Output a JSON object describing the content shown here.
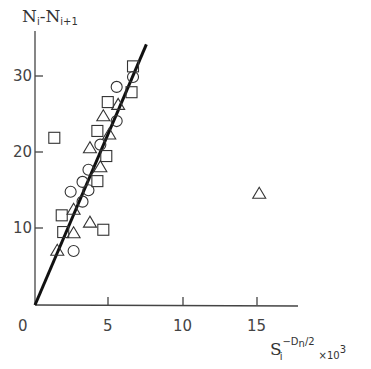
{
  "chart_data": {
    "type": "scatter",
    "title": "",
    "xlabel": "S_i^(-D_n/2) ×10^3",
    "ylabel": "N_i - N_i+1",
    "xlim": [
      0,
      18
    ],
    "ylim": [
      0,
      36
    ],
    "x_ticks": [
      "0",
      "5",
      "10",
      "15"
    ],
    "y_ticks": [
      "10",
      "20",
      "30"
    ],
    "grid": false,
    "legend": null,
    "series": [
      {
        "name": "squares",
        "marker": "square",
        "points": [
          [
            6.6,
            31.4
          ],
          [
            6.5,
            28.0
          ],
          [
            4.9,
            26.7
          ],
          [
            4.2,
            22.9
          ],
          [
            1.3,
            22.0
          ],
          [
            4.8,
            19.6
          ],
          [
            4.2,
            16.3
          ],
          [
            1.8,
            11.8
          ],
          [
            1.9,
            9.6
          ],
          [
            4.6,
            9.9
          ]
        ]
      },
      {
        "name": "circles",
        "marker": "circle",
        "points": [
          [
            6.6,
            30.0
          ],
          [
            5.5,
            28.7
          ],
          [
            5.5,
            24.2
          ],
          [
            4.4,
            21.1
          ],
          [
            3.6,
            17.8
          ],
          [
            3.2,
            16.2
          ],
          [
            3.6,
            15.1
          ],
          [
            2.4,
            14.9
          ],
          [
            3.2,
            13.6
          ],
          [
            2.6,
            7.1
          ]
        ]
      },
      {
        "name": "triangles",
        "marker": "triangle",
        "points": [
          [
            5.6,
            26.4
          ],
          [
            4.6,
            24.9
          ],
          [
            5.0,
            22.5
          ],
          [
            3.7,
            20.7
          ],
          [
            4.4,
            18.2
          ],
          [
            2.6,
            12.6
          ],
          [
            3.7,
            10.9
          ],
          [
            2.6,
            9.5
          ],
          [
            1.5,
            7.2
          ],
          [
            15.1,
            14.7
          ]
        ]
      }
    ],
    "fit_line": {
      "from": [
        0,
        0
      ],
      "to": [
        7.5,
        34.3
      ]
    }
  },
  "labels": {
    "y_axis_main": "N",
    "y_axis_sub1": "i",
    "y_axis_dash": "-N",
    "y_axis_sub2": "i+1",
    "x_axis_main": "S",
    "x_axis_sub": "i",
    "x_axis_sup": "−D",
    "x_axis_sup_sub": "n",
    "x_axis_sup_tail": "/2",
    "x_axis_mult": "×10",
    "x_axis_mult_sup": "3",
    "origin": "0",
    "x5": "5",
    "x10": "10",
    "x15": "15",
    "y10": "10",
    "y20": "20",
    "y30": "30"
  }
}
